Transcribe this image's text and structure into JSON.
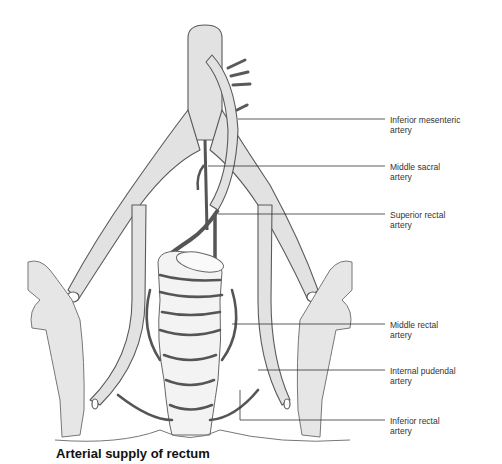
{
  "figure": {
    "colors": {
      "vessel_fill": "#e2e2e2",
      "vessel_stroke": "#5a5a5a",
      "rectal_artery": "#555555",
      "bone_fill": "#e6e6e6",
      "leader_line": "#333333",
      "label_text": "#333333"
    },
    "labels": [
      {
        "id": "inferior-mesenteric-artery",
        "text": "Inferior mesenteric\nartery",
        "top": 117
      },
      {
        "id": "middle-sacral-artery",
        "text": "Middle sacral\nartery",
        "top": 166
      },
      {
        "id": "superior-rectal-artery",
        "text": "Superior rectal\nartery",
        "top": 212
      },
      {
        "id": "middle-rectal-artery",
        "text": "Middle rectal\nartery",
        "top": 322
      },
      {
        "id": "internal-pudendal-artery",
        "text": "Internal pudendal\nartery",
        "top": 368
      },
      {
        "id": "inferior-rectal-artery",
        "text": "Inferior rectal\nartery",
        "top": 415
      }
    ],
    "caption": "Arterial supply of rectum"
  }
}
